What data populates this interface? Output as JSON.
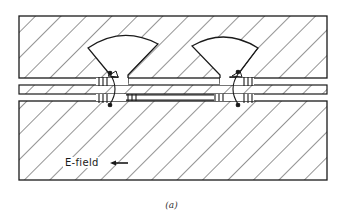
{
  "figure": {
    "caption": "(a)",
    "efield_label": "E-field",
    "efield_arrow": "left",
    "stroke_color": "#1a1a1a",
    "hatch_color": "#2a2a2a",
    "background": "#ffffff"
  },
  "layout": {
    "top_block": {
      "x": 19,
      "y": 16,
      "w": 308,
      "h": 62
    },
    "strip": {
      "x": 19,
      "y": 85,
      "w": 308,
      "h": 9
    },
    "bottom_block": {
      "x": 19,
      "y": 101,
      "w": 308,
      "h": 79
    },
    "cavities": [
      {
        "side": "left",
        "apex_x": 114,
        "apex_y": 76,
        "arc_left_x": 88,
        "arc_right_x": 158,
        "arc_top_y": 35
      },
      {
        "side": "right",
        "apex_x": 229,
        "apex_y": 76,
        "arc_left_x": 192,
        "arc_right_x": 258,
        "arc_top_y": 35
      }
    ]
  }
}
